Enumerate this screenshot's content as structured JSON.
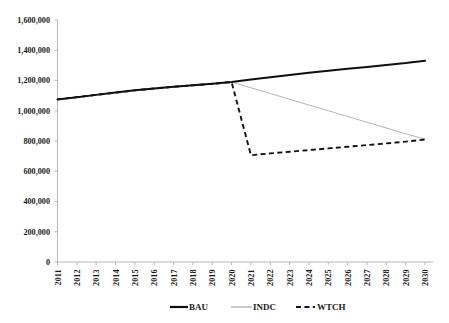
{
  "chart_data": {
    "type": "line",
    "title": "",
    "xlabel": "",
    "ylabel": "",
    "grid": false,
    "legend_position": "bottom",
    "categories": [
      "2011",
      "2012",
      "2013",
      "2014",
      "2015",
      "2016",
      "2017",
      "2018",
      "2019",
      "2020",
      "2021",
      "2022",
      "2023",
      "2024",
      "2025",
      "2026",
      "2027",
      "2028",
      "2029",
      "2030"
    ],
    "ylim": [
      0,
      1600000
    ],
    "ytick_labels": [
      "0",
      "200,000",
      "400,000",
      "600,000",
      "800,000",
      "1,000,000",
      "1,200,000",
      "1,400,000",
      "1,600,000"
    ],
    "ytick_values": [
      0,
      200000,
      400000,
      600000,
      800000,
      1000000,
      1200000,
      1400000,
      1600000
    ],
    "series": [
      {
        "name": "BAU",
        "color": "#0f0f0f",
        "style": "solid-thick",
        "values": [
          1075000,
          1090000,
          1105000,
          1120000,
          1135000,
          1147000,
          1158000,
          1168000,
          1178000,
          1190000,
          1207000,
          1222000,
          1237000,
          1251000,
          1264000,
          1277000,
          1290000,
          1303000,
          1315000,
          1330000
        ]
      },
      {
        "name": "INDC",
        "color": "#b5b5b5",
        "style": "solid-thin",
        "values": [
          1075000,
          1090000,
          1105000,
          1120000,
          1135000,
          1147000,
          1158000,
          1168000,
          1178000,
          1190000,
          1152000,
          1114000,
          1076000,
          1038000,
          1000000,
          962000,
          924000,
          886000,
          848000,
          812000
        ]
      },
      {
        "name": "WTCH",
        "color": "#121212",
        "style": "dashed",
        "values": [
          1075000,
          1090000,
          1105000,
          1120000,
          1135000,
          1147000,
          1158000,
          1168000,
          1178000,
          1190000,
          706000,
          718000,
          729000,
          740000,
          751000,
          762000,
          773000,
          784000,
          796000,
          810000
        ]
      }
    ]
  },
  "legend": {
    "items": [
      {
        "label": "BAU"
      },
      {
        "label": "INDC"
      },
      {
        "label": "WTCH"
      }
    ]
  }
}
